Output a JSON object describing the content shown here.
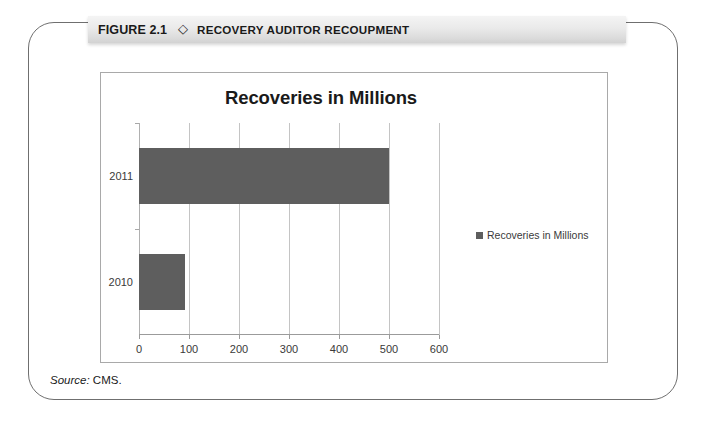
{
  "figure": {
    "number_label": "FIGURE 2.1",
    "diamond_glyph": "◇",
    "title": "RECOVERY AUDITOR RECOUPMENT",
    "source_keyword": "Source:",
    "source_value": "CMS."
  },
  "colors": {
    "bar": "#5e5e5e",
    "gridline": "#c4c4c4",
    "axis": "#9b9b9b",
    "frame_border": "#6f6f6f",
    "chart_border": "#a9a9a9",
    "title_bar_start": "#f4f4f4",
    "title_bar_end": "#d2d2d2",
    "text": "#1a1a1a"
  },
  "chart_data": {
    "type": "bar",
    "orientation": "horizontal",
    "title": "Recoveries in Millions",
    "xlabel": "",
    "ylabel": "",
    "categories": [
      "2010",
      "2011"
    ],
    "values": [
      92,
      500
    ],
    "series": [
      {
        "name": "Recoveries in Millions",
        "values": [
          92,
          500
        ]
      }
    ],
    "xlim": [
      0,
      600
    ],
    "xticks": [
      0,
      100,
      200,
      300,
      400,
      500,
      600
    ],
    "xtick_labels": [
      "0",
      "100",
      "200",
      "300",
      "400",
      "500",
      "600"
    ],
    "ytick_labels": [
      "2010",
      "2011"
    ],
    "grid": true,
    "grid_axis": "x",
    "legend": {
      "position": "right",
      "entries": [
        "Recoveries in Millions"
      ]
    }
  }
}
